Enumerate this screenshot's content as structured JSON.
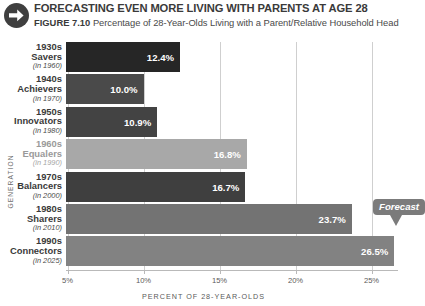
{
  "header": {
    "icon": "arrow-right-circle-icon",
    "title": "FORECASTING EVEN MORE LIVING WITH PARENTS AT AGE 28",
    "figure_number": "FIGURE 7.10",
    "figure_caption": "Percentage of 28-Year-Olds Living with a Parent/Relative Household Head"
  },
  "chart_data": {
    "type": "bar",
    "orientation": "horizontal",
    "title": "FORECASTING EVEN MORE LIVING WITH PARENTS AT AGE 28",
    "subtitle": "Percentage of 28-Year-Olds Living with a Parent/Relative Household Head",
    "xlabel": "PERCENT OF 28-YEAR-OLDS",
    "ylabel": "GENERATION",
    "xlim": [
      4.9,
      26.9
    ],
    "xticks": [
      "5%",
      "10%",
      "15%",
      "20%",
      "25%"
    ],
    "xtick_values": [
      5,
      10,
      15,
      20,
      25
    ],
    "grid": "vertical",
    "legend": "none",
    "categories": [
      "1930s Savers (in 1960)",
      "1940s Achievers (in 1970)",
      "1950s Innovators (in 1980)",
      "1960s Equalers (in 1990)",
      "1970s Balancers (in 2000)",
      "1980s Sharers (in 2010)",
      "1990s Connectors (in 2025)"
    ],
    "values": [
      12.4,
      10.0,
      10.9,
      16.8,
      16.7,
      23.7,
      26.5
    ],
    "value_labels": [
      "12.4%",
      "10.0%",
      "10.9%",
      "16.8%",
      "16.7%",
      "23.7%",
      "26.5%"
    ],
    "bar_colors": [
      "#262626",
      "#4a4a4a",
      "#434343",
      "#a8a8a8",
      "#3f3f3f",
      "#737373",
      "#828282"
    ],
    "annotations": [
      {
        "text": "Forecast",
        "points_to_category": "1990s Connectors (in 2025)"
      }
    ]
  },
  "rows": [
    {
      "year": "1930s",
      "name": "Savers",
      "in": "(in 1960)",
      "value_label": "12.4%",
      "muted": false
    },
    {
      "year": "1940s",
      "name": "Achievers",
      "in": "(in 1970)",
      "value_label": "10.0%",
      "muted": false
    },
    {
      "year": "1950s",
      "name": "Innovators",
      "in": "(in 1980)",
      "value_label": "10.9%",
      "muted": false
    },
    {
      "year": "1960s",
      "name": "Equalers",
      "in": "(in 1990)",
      "value_label": "16.8%",
      "muted": true
    },
    {
      "year": "1970s",
      "name": "Balancers",
      "in": "(in 2000)",
      "value_label": "16.7%",
      "muted": false
    },
    {
      "year": "1980s",
      "name": "Sharers",
      "in": "(in 2010)",
      "value_label": "23.7%",
      "muted": false
    },
    {
      "year": "1990s",
      "name": "Connectors",
      "in": "(in 2025)",
      "value_label": "26.5%",
      "muted": false
    }
  ],
  "axis": {
    "ticks": [
      "5%",
      "10%",
      "15%",
      "20%",
      "25%"
    ],
    "xlabel": "PERCENT OF 28-YEAR-OLDS",
    "ylabel": "GENERATION"
  },
  "callout": {
    "label": "Forecast"
  },
  "colors": {
    "grid": "#cfcfcf",
    "axis": "#b9b9b9",
    "text": "#3a3a3a",
    "muted_text": "#9a9a9a",
    "callout_bg": "#7b7b7b"
  }
}
